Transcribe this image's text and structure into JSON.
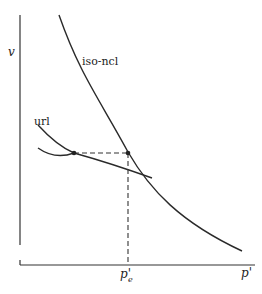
{
  "diagram": {
    "type": "soil-mechanics-compression-plot",
    "axes": {
      "y_label": "v",
      "x_label": "p'",
      "x_marker_label": "p'",
      "x_marker_subscript": "e"
    },
    "curves": [
      {
        "name": "iso-ncl",
        "label": "iso-ncl"
      },
      {
        "name": "url",
        "label": "url"
      }
    ],
    "points": [
      {
        "name": "url-start-point"
      },
      {
        "name": "iso-ncl-point"
      }
    ],
    "colors": {
      "line": "#2a2a2a",
      "background": "#ffffff"
    }
  }
}
